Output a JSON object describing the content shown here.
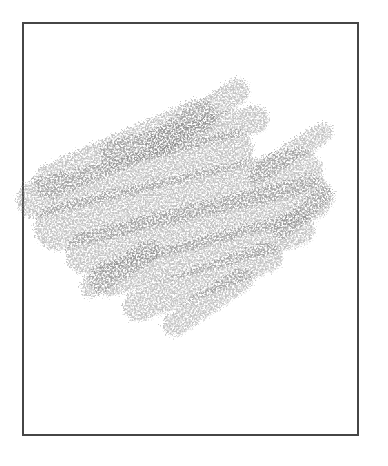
{
  "page": {
    "background_color": "#ffffff",
    "width": 388,
    "height": 466
  },
  "frame": {
    "x": 22,
    "y": 22,
    "width": 337,
    "height": 414,
    "border_width": 2,
    "border_color": "#464646",
    "fill_color": "#ffffff"
  },
  "drawing": {
    "description": "gray crayon scribble of overlapping diagonal strokes",
    "stroke_color": "#8a8a8a",
    "stroke_opacity": 0.5,
    "grain": {
      "base_frequency": 0.55,
      "octaves": 3,
      "seed": 4,
      "displacement_scale": 14
    },
    "strokes": [
      {
        "x1": 160,
        "y1": 143,
        "x2": 237,
        "y2": 92,
        "w": 26
      },
      {
        "x1": 258,
        "y1": 175,
        "x2": 323,
        "y2": 133,
        "w": 20
      },
      {
        "x1": 52,
        "y1": 182,
        "x2": 200,
        "y2": 117,
        "w": 36
      },
      {
        "x1": 115,
        "y1": 155,
        "x2": 255,
        "y2": 120,
        "w": 28
      },
      {
        "x1": 36,
        "y1": 200,
        "x2": 235,
        "y2": 150,
        "w": 38
      },
      {
        "x1": 58,
        "y1": 228,
        "x2": 300,
        "y2": 172,
        "w": 46
      },
      {
        "x1": 88,
        "y1": 254,
        "x2": 312,
        "y2": 198,
        "w": 44
      },
      {
        "x1": 108,
        "y1": 280,
        "x2": 298,
        "y2": 230,
        "w": 34
      },
      {
        "x1": 138,
        "y1": 307,
        "x2": 268,
        "y2": 258,
        "w": 30
      },
      {
        "x1": 175,
        "y1": 325,
        "x2": 242,
        "y2": 280,
        "w": 24
      },
      {
        "x1": 92,
        "y1": 287,
        "x2": 150,
        "y2": 252,
        "w": 22
      },
      {
        "x1": 282,
        "y1": 232,
        "x2": 324,
        "y2": 196,
        "w": 18
      }
    ]
  }
}
